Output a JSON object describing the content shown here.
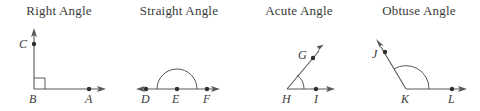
{
  "figure": {
    "width": 480,
    "height": 111,
    "background_color": "#ffffff",
    "line_color": "#585858",
    "label_color": "#3a3a3a",
    "dot_color": "#2e2e2e"
  },
  "panels": [
    {
      "id": "right-angle",
      "title": "Right Angle",
      "angle_type": "right",
      "marker": "square",
      "vertex_label": "B",
      "points": [
        {
          "name": "C",
          "label": "C",
          "role": "ray-point-vertical"
        },
        {
          "name": "B",
          "label": "B",
          "role": "vertex"
        },
        {
          "name": "A",
          "label": "A",
          "role": "ray-point-horizontal"
        }
      ]
    },
    {
      "id": "straight-angle",
      "title": "Straight Angle",
      "angle_type": "straight",
      "marker": "semicircle",
      "vertex_label": "E",
      "points": [
        {
          "name": "D",
          "label": "D",
          "role": "ray-point-left"
        },
        {
          "name": "E",
          "label": "E",
          "role": "vertex"
        },
        {
          "name": "F",
          "label": "F",
          "role": "ray-point-right"
        }
      ]
    },
    {
      "id": "acute-angle",
      "title": "Acute Angle",
      "angle_type": "acute",
      "marker": "arc",
      "vertex_label": "H",
      "points": [
        {
          "name": "G",
          "label": "G",
          "role": "ray-point-upper"
        },
        {
          "name": "H",
          "label": "H",
          "role": "vertex"
        },
        {
          "name": "I",
          "label": "I",
          "role": "ray-point-horizontal"
        }
      ]
    },
    {
      "id": "obtuse-angle",
      "title": "Obtuse Angle",
      "angle_type": "obtuse",
      "marker": "arc",
      "vertex_label": "K",
      "points": [
        {
          "name": "J",
          "label": "J",
          "role": "ray-point-upper-left"
        },
        {
          "name": "K",
          "label": "K",
          "role": "vertex"
        },
        {
          "name": "L",
          "label": "L",
          "role": "ray-point-horizontal"
        }
      ]
    }
  ]
}
